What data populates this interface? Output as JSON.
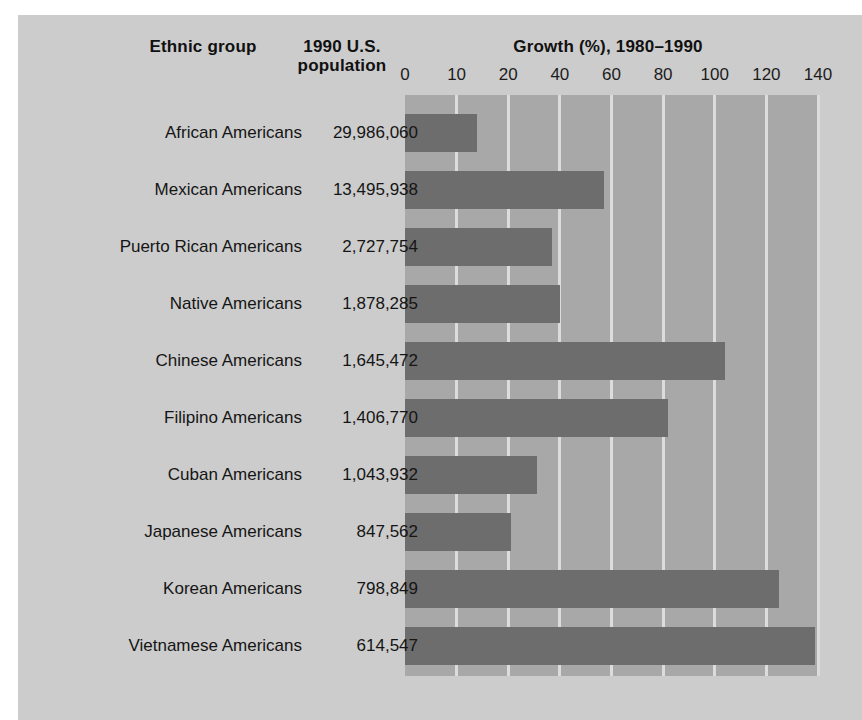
{
  "header": {
    "col_group": "Ethnic group",
    "col_population": "1990 U.S.\npopulation",
    "col_population_line1": "1990 U.S.",
    "col_population_line2": "population",
    "chart_title": "Growth (%), 1980–1990"
  },
  "colors": {
    "page_background": "#ffffff",
    "panel_background": "#cccccc",
    "plot_background": "#a8a8a8",
    "bar": "#6d6d6d",
    "gridline": "#dcdcdc",
    "text": "#151515"
  },
  "chart_data": {
    "type": "bar",
    "orientation": "horizontal",
    "title": "Growth (%), 1980–1990",
    "xlabel": "Growth (%), 1980–1990",
    "ylabel": "Ethnic group",
    "grid": true,
    "legend": "none",
    "tick_labels": [
      "0",
      "10",
      "20",
      "40",
      "60",
      "80",
      "100",
      "120",
      "140"
    ],
    "tick_values": [
      0,
      10,
      20,
      40,
      60,
      80,
      100,
      120,
      140
    ],
    "xlim": [
      0,
      140
    ],
    "categories": [
      "African Americans",
      "Mexican Americans",
      "Puerto Rican Americans",
      "Native Americans",
      "Chinese Americans",
      "Filipino Americans",
      "Cuban Americans",
      "Japanese Americans",
      "Korean Americans",
      "Vietnamese Americans"
    ],
    "values": [
      14,
      57,
      37,
      40,
      104,
      82,
      31,
      21,
      125,
      139
    ],
    "populations": [
      "29,986,060",
      "13,495,938",
      "2,727,754",
      "1,878,285",
      "1,645,472",
      "1,406,770",
      "1,043,932",
      "847,562",
      "798,849",
      "614,547"
    ],
    "rows": [
      {
        "label": "African Americans",
        "population": "29,986,060",
        "growth": 14
      },
      {
        "label": "Mexican Americans",
        "population": "13,495,938",
        "growth": 57
      },
      {
        "label": "Puerto Rican Americans",
        "population": "2,727,754",
        "growth": 37
      },
      {
        "label": "Native Americans",
        "population": "1,878,285",
        "growth": 40
      },
      {
        "label": "Chinese Americans",
        "population": "1,645,472",
        "growth": 104
      },
      {
        "label": "Filipino Americans",
        "population": "1,406,770",
        "growth": 82
      },
      {
        "label": "Cuban Americans",
        "population": "1,043,932",
        "growth": 31
      },
      {
        "label": "Japanese Americans",
        "population": "847,562",
        "growth": 21
      },
      {
        "label": "Korean Americans",
        "population": "798,849",
        "growth": 125
      },
      {
        "label": "Vietnamese Americans",
        "population": "614,547",
        "growth": 139
      }
    ]
  }
}
